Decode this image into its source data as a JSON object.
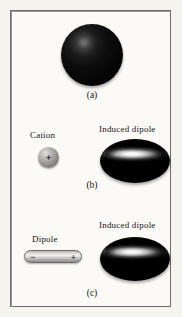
{
  "figure": {
    "background_color": "#f6f4ef",
    "frame_color": "#6b6b6b"
  },
  "panels": [
    {
      "id": "a",
      "caption": "(a)",
      "objects": [
        {
          "kind": "sphere",
          "name": "nonpolar-atom",
          "label": "",
          "color": "#0a0a0a"
        }
      ]
    },
    {
      "id": "b",
      "caption": "(b)",
      "objects": [
        {
          "kind": "sphere",
          "name": "cation",
          "label": "Cation",
          "charge": "+",
          "color": "#9a9794"
        },
        {
          "kind": "ellipse",
          "name": "induced-dipole",
          "label": "Induced dipole",
          "color": "#0a0a0a"
        }
      ]
    },
    {
      "id": "c",
      "caption": "(c)",
      "objects": [
        {
          "kind": "bar",
          "name": "dipole",
          "label": "Dipole",
          "charge_left": "−",
          "charge_right": "+",
          "color": "#dfdedb"
        },
        {
          "kind": "ellipse",
          "name": "induced-dipole",
          "label": "Induced dipole",
          "color": "#0a0a0a"
        }
      ]
    }
  ],
  "labels": {
    "panel_a": "(a)",
    "panel_b": "(b)",
    "panel_c": "(c)",
    "cation": "Cation",
    "dipole": "Dipole",
    "induced_dipole_b": "Induced dipole",
    "induced_dipole_c": "Induced dipole",
    "cation_charge": "+",
    "dipole_negative_charge": "−",
    "dipole_positive_charge": "+"
  }
}
